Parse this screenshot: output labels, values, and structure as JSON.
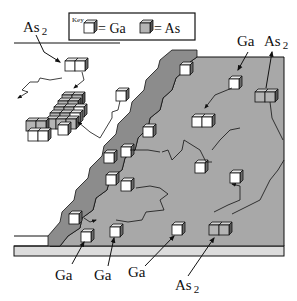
{
  "diagram": {
    "type": "MBE surface growth schematic",
    "key": {
      "title": "Key",
      "items": [
        {
          "symbol": "white-cube",
          "label": "= Ga"
        },
        {
          "symbol": "gray-cube",
          "label": "= As"
        }
      ]
    },
    "labels": {
      "top_left_species": "As",
      "top_left_sub": "2",
      "top_right_ga": "Ga",
      "top_right_as": "As",
      "top_right_as_sub": "2",
      "bottom_ga_1": "Ga",
      "bottom_ga_2": "Ga",
      "bottom_ga_3": "Ga",
      "bottom_as": "As",
      "bottom_as_sub": "2"
    },
    "colors": {
      "terrace": "#a8a8a8",
      "step_face": "#8c8c8c",
      "ga_cube": "#ffffff",
      "as_cube": "#b4b4b4",
      "substrate_band": "#dcdcdc",
      "line": "#111111"
    }
  }
}
